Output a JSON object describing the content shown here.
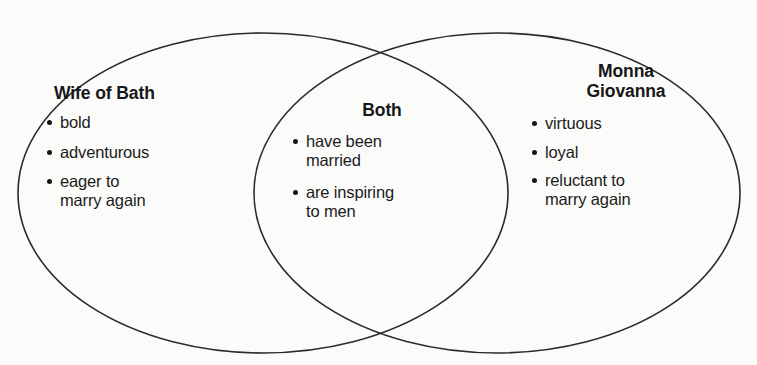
{
  "diagram": {
    "type": "venn",
    "title_visible": false,
    "background_color": "#fbfbf9",
    "stroke_color": "#2a2a2a",
    "text_color": "#1a1a1a",
    "sets": [
      {
        "id": "left",
        "name": "wife-of-bath",
        "title": "Wife of Bath",
        "title_lines": [
          "Wife of Bath"
        ],
        "items": [
          "bold",
          "adventurous",
          "eager to\nmarry again"
        ],
        "items_display": [
          "bold",
          "adventurous",
          "eager to marry again"
        ]
      },
      {
        "id": "center",
        "name": "both",
        "title": "Both",
        "title_lines": [
          "Both"
        ],
        "items": [
          "have been\nmarried",
          "are inspiring\nto men"
        ],
        "items_display": [
          "have been married",
          "are inspiring to men"
        ]
      },
      {
        "id": "right",
        "name": "monna-giovanna",
        "title": "Monna Giovanna",
        "title_lines": [
          "Monna",
          "Giovanna"
        ],
        "items": [
          "virtuous",
          "loyal",
          "reluctant to\nmarry again"
        ],
        "items_display": [
          "virtuous",
          "loyal",
          "reluctant to marry again"
        ]
      }
    ]
  },
  "left": {
    "title": "Wife of Bath",
    "bullets": [
      {
        "line1": "bold",
        "line2": ""
      },
      {
        "line1": "adventurous",
        "line2": ""
      },
      {
        "line1": "eager to",
        "line2": "marry again"
      }
    ]
  },
  "center": {
    "title": "Both",
    "bullets": [
      {
        "line1": "have been",
        "line2": "married"
      },
      {
        "line1": "are inspiring",
        "line2": "to men"
      }
    ]
  },
  "right": {
    "title_line1": "Monna",
    "title_line2": "Giovanna",
    "bullets": [
      {
        "line1": "virtuous",
        "line2": ""
      },
      {
        "line1": "loyal",
        "line2": ""
      },
      {
        "line1": "reluctant to",
        "line2": "marry again"
      }
    ]
  }
}
